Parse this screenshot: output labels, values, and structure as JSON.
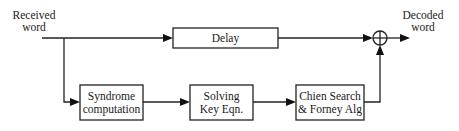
{
  "diagram": {
    "type": "block-diagram",
    "input_label": [
      "Received",
      "word"
    ],
    "output_label": [
      "Decoded",
      "word"
    ],
    "blocks": {
      "delay": [
        "Delay"
      ],
      "syndrome": [
        "Syndrome",
        "computation"
      ],
      "solving": [
        "Solving",
        "Key Eqn."
      ],
      "chien": [
        "Chien Search",
        "& Forney Alg"
      ]
    },
    "adder_symbol": "XOR / modulo-2 adder",
    "edges": [
      {
        "from": "input",
        "to": "delay"
      },
      {
        "from": "input",
        "to": "syndrome"
      },
      {
        "from": "syndrome",
        "to": "solving"
      },
      {
        "from": "solving",
        "to": "chien"
      },
      {
        "from": "delay",
        "to": "adder"
      },
      {
        "from": "chien",
        "to": "adder"
      },
      {
        "from": "adder",
        "to": "output"
      }
    ]
  }
}
